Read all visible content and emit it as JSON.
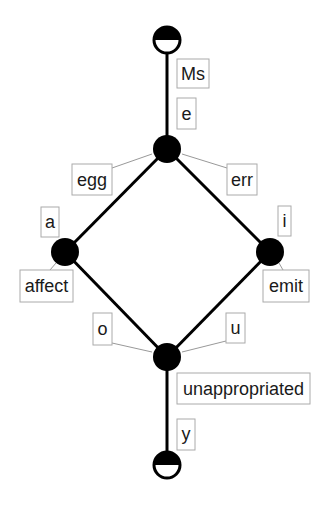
{
  "diagram": {
    "type": "concept-lattice",
    "colors": {
      "node": "#000000",
      "edge": "#000000",
      "label_border": "#aaaaaa",
      "leader_line": "#999999",
      "text": "#1a1a1a",
      "background": "#ffffff"
    },
    "nodes": [
      {
        "id": "top",
        "style": "half-filled-top",
        "x": 167,
        "y": 40,
        "r": 13
      },
      {
        "id": "n1",
        "style": "filled",
        "x": 167,
        "y": 149,
        "r": 14
      },
      {
        "id": "n2",
        "style": "filled",
        "x": 65,
        "y": 252,
        "r": 14
      },
      {
        "id": "n3",
        "style": "filled",
        "x": 270,
        "y": 252,
        "r": 14
      },
      {
        "id": "n4",
        "style": "filled",
        "x": 167,
        "y": 357,
        "r": 14
      },
      {
        "id": "bottom",
        "style": "half-filled-bottom",
        "x": 167,
        "y": 465,
        "r": 13
      }
    ],
    "edges": [
      {
        "from": "top",
        "to": "n1"
      },
      {
        "from": "n1",
        "to": "n2"
      },
      {
        "from": "n1",
        "to": "n3"
      },
      {
        "from": "n2",
        "to": "n4"
      },
      {
        "from": "n3",
        "to": "n4"
      },
      {
        "from": "n4",
        "to": "bottom"
      }
    ],
    "labels": {
      "ms": "Ms",
      "e": "e",
      "egg": "egg",
      "err": "err",
      "a": "a",
      "affect": "affect",
      "i": "i",
      "emit": "emit",
      "o": "o",
      "u": "u",
      "unappropriated": "unappropriated",
      "y": "y"
    }
  }
}
